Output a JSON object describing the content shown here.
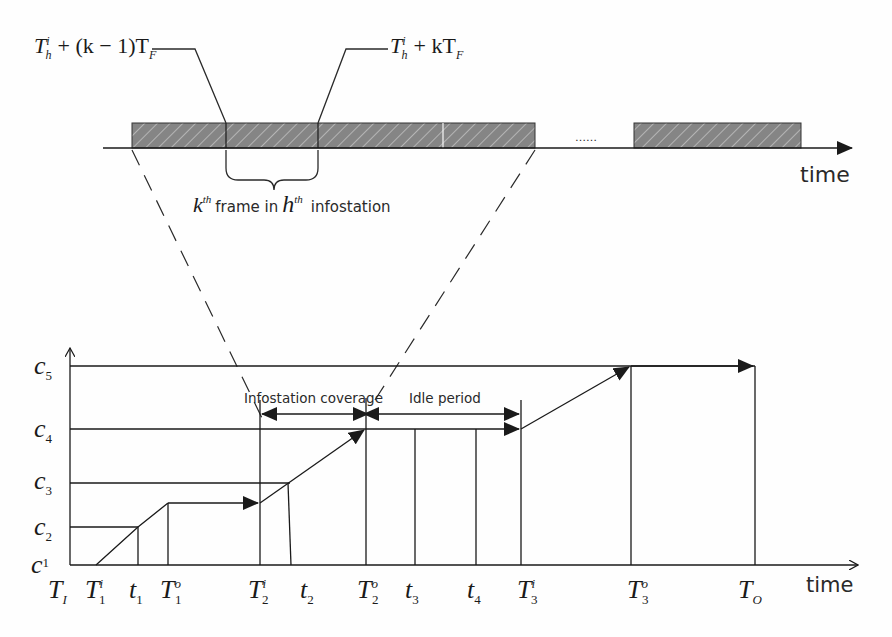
{
  "top_timeline": {
    "formula_left": {
      "base": "T",
      "sup": "i",
      "sub": "h",
      "rest": "+ (k − 1)T",
      "rest_sub": "F"
    },
    "formula_right": {
      "base": "T",
      "sup": "i",
      "sub": "h",
      "rest": "+ kT",
      "rest_sub": "F"
    },
    "brace_label": {
      "k": "k",
      "k_sup": "th",
      "middle": "frame in",
      "h": "h",
      "h_sup": "th",
      "tail": "infostation"
    },
    "ellipsis": "……",
    "axis_label": "time",
    "hatch_color": "#7a7a7a"
  },
  "bottom_chart": {
    "y_levels": [
      {
        "base": "c",
        "sub": "5"
      },
      {
        "base": "c",
        "sub": "4"
      },
      {
        "base": "c",
        "sub": "3"
      },
      {
        "base": "c",
        "sub": "2"
      },
      {
        "base": "c",
        "sub": "1"
      }
    ],
    "x_ticks": [
      {
        "base": "T",
        "sub": "I",
        "sup": ""
      },
      {
        "base": "T",
        "sub": "1",
        "sup": "i"
      },
      {
        "base": "t",
        "sub": "1",
        "sup": ""
      },
      {
        "base": "T",
        "sub": "1",
        "sup": "o"
      },
      {
        "base": "T",
        "sub": "2",
        "sup": "i"
      },
      {
        "base": "t",
        "sub": "2",
        "sup": ""
      },
      {
        "base": "T",
        "sub": "2",
        "sup": "o"
      },
      {
        "base": "t",
        "sub": "3",
        "sup": ""
      },
      {
        "base": "t",
        "sub": "4",
        "sup": ""
      },
      {
        "base": "T",
        "sub": "3",
        "sup": "i"
      },
      {
        "base": "T",
        "sub": "3",
        "sup": "o"
      },
      {
        "base": "T",
        "sub": "O",
        "sup": ""
      }
    ],
    "annotations": {
      "coverage": "Infostation coverage",
      "idle": "Idle period"
    },
    "axis_label": "time"
  }
}
